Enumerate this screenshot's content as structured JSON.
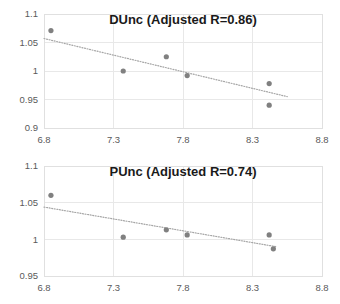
{
  "chart_data": [
    {
      "type": "scatter",
      "id": "dunc",
      "title": "DUnc (Adjusted R=0.86)",
      "xlabel": "",
      "ylabel": "",
      "xlim": [
        6.8,
        8.8
      ],
      "ylim": [
        0.9,
        1.1
      ],
      "xticks": [
        "6.8",
        "7.3",
        "7.8",
        "8.3",
        "8.8"
      ],
      "xtick_values": [
        6.8,
        7.3,
        7.8,
        8.3,
        8.8
      ],
      "yticks": [
        "0.9",
        "0.95",
        "1",
        "1.05",
        "1.1"
      ],
      "ytick_values": [
        0.9,
        0.95,
        1.0,
        1.05,
        1.1
      ],
      "grid": true,
      "legend": "none",
      "marker_color": "#808080",
      "trendline_color": "#a6a6a6",
      "trendline_style": "dotted",
      "points": [
        {
          "x": 6.85,
          "y": 1.071
        },
        {
          "x": 7.37,
          "y": 1.0
        },
        {
          "x": 7.68,
          "y": 1.025
        },
        {
          "x": 7.83,
          "y": 0.992
        },
        {
          "x": 8.42,
          "y": 0.978
        },
        {
          "x": 8.42,
          "y": 0.94
        }
      ],
      "trendline": {
        "x1": 6.8,
        "y1": 1.057,
        "x2": 8.55,
        "y2": 0.955
      }
    },
    {
      "type": "scatter",
      "id": "punc",
      "title": "PUnc (Adjusted R=0.74)",
      "xlabel": "",
      "ylabel": "",
      "xlim": [
        6.8,
        8.8
      ],
      "ylim": [
        0.95,
        1.1
      ],
      "xticks": [
        "6.8",
        "7.3",
        "7.8",
        "8.3",
        "8.8"
      ],
      "xtick_values": [
        6.8,
        7.3,
        7.8,
        8.3,
        8.8
      ],
      "yticks": [
        "0.95",
        "1",
        "1.05",
        "1.1"
      ],
      "ytick_values": [
        0.95,
        1.0,
        1.05,
        1.1
      ],
      "grid": true,
      "legend": "none",
      "marker_color": "#808080",
      "trendline_color": "#a6a6a6",
      "trendline_style": "dotted",
      "points": [
        {
          "x": 6.85,
          "y": 1.06
        },
        {
          "x": 7.37,
          "y": 1.003
        },
        {
          "x": 7.68,
          "y": 1.013
        },
        {
          "x": 7.83,
          "y": 1.006
        },
        {
          "x": 8.42,
          "y": 1.006
        },
        {
          "x": 8.45,
          "y": 0.987
        }
      ],
      "trendline": {
        "x1": 6.8,
        "y1": 1.044,
        "x2": 8.47,
        "y2": 0.99
      }
    }
  ]
}
